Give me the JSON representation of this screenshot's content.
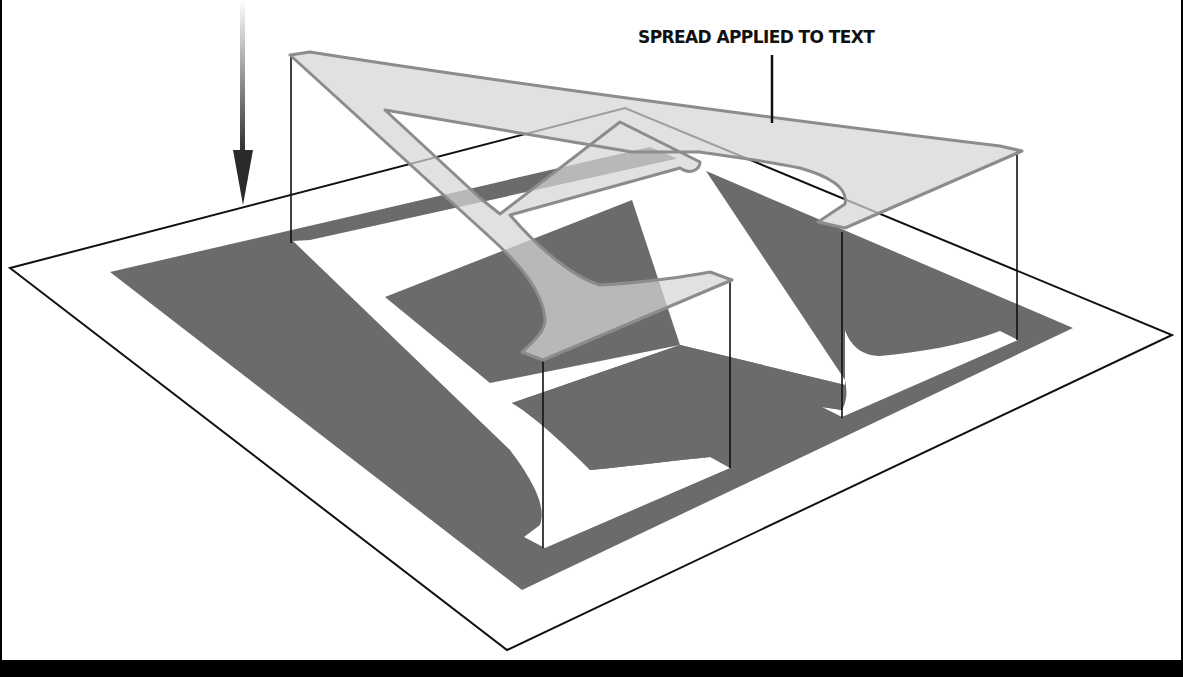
{
  "figure": {
    "callout_label": "SPREAD APPLIED TO TEXT",
    "elements": {
      "arrow": "down-arrow-icon",
      "sheet": "white-sheet",
      "plate": "gray-plate",
      "ground_glyph": "letter-a-knockout",
      "elevated_glyph": "spread-letter-a"
    },
    "colors": {
      "background": "#ffffff",
      "plate": "#6b6b6b",
      "glyph_knockout": "#ffffff",
      "spread_fill": "#d4d4d4",
      "spread_stroke": "#8c8c8c",
      "lines": "#111111",
      "frame": "#000000"
    }
  }
}
